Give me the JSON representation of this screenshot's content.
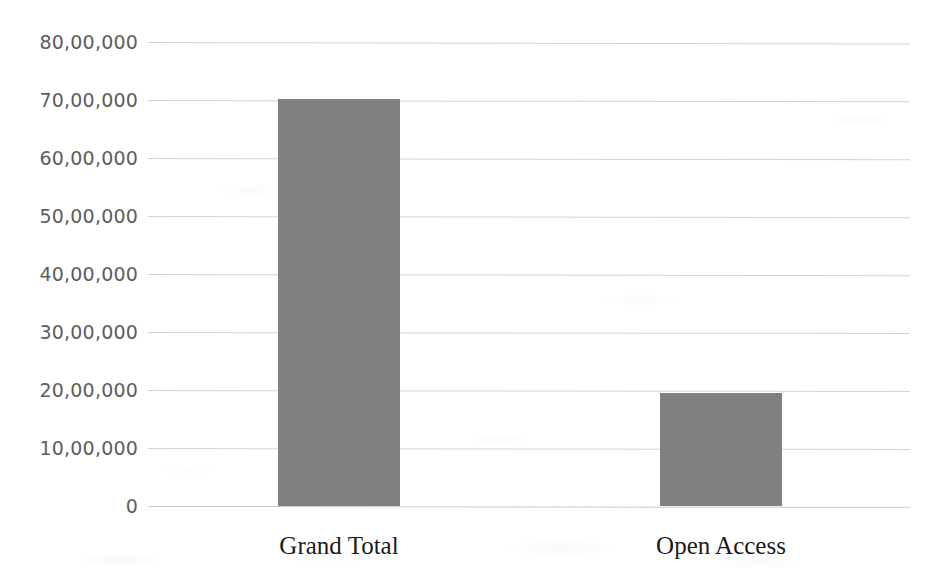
{
  "chart_data": {
    "type": "bar",
    "title": "",
    "subtitle": "",
    "xlabel": "",
    "ylabel": "",
    "categories": [
      "Grand Total",
      "Open Access"
    ],
    "values": [
      7020000,
      1950000
    ],
    "value_labels": [
      "70,20,000",
      "19,50,000"
    ],
    "ylim": [
      0,
      8000000
    ],
    "ytick_values": [
      8000000,
      7000000,
      6000000,
      5000000,
      4000000,
      3000000,
      2000000,
      1000000,
      0
    ],
    "ytick_labels": [
      "80,00,000",
      "70,00,000",
      "60,00,000",
      "50,00,000",
      "40,00,000",
      "30,00,000",
      "20,00,000",
      "10,00,000",
      "0"
    ],
    "number_format": "indian-lakh",
    "grid": {
      "horizontal": true,
      "vertical": false,
      "color": "#d4d4d4"
    },
    "legend": {
      "visible": false,
      "position": "none"
    },
    "series": [
      {
        "name": "Records",
        "color": "#808080",
        "values": [
          7020000,
          1950000
        ]
      }
    ]
  },
  "style": {
    "background": "#ffffff",
    "bar_color": "#808080",
    "gridline_color": "#d4d4d4",
    "baseline_color": "#c9c9c9",
    "ytick_color": "#5d5d5d",
    "xtick_color": "#1a1a1a"
  }
}
